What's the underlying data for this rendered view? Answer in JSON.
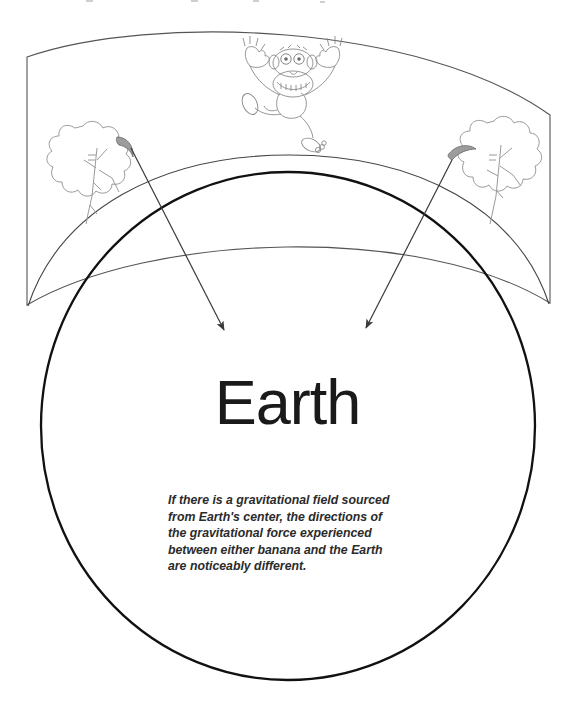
{
  "figure": {
    "title": "Earth",
    "caption": "If there is a gravitational field sourced from Earth's center, the directions of the gravitational force experienced between either banana and the Earth are noticeably different.",
    "colors": {
      "earth_outline": "#111111",
      "ground_band_outline": "#555555",
      "sketch_line": "#8d8d8d",
      "arrow": "#3a3a3a",
      "text": "#1a1a1a",
      "background": "#ffffff"
    },
    "elements": {
      "earth_circle": "earth-circle",
      "inner_arc": "earth-inner-arc",
      "ground_band": "curved-ground-band",
      "left_tree": "tree-left",
      "right_tree": "tree-right",
      "left_banana": "banana-left",
      "right_banana": "banana-right",
      "monkey": "monkey-figure",
      "left_arrow": "gravity-arrow-left",
      "right_arrow": "gravity-arrow-right"
    }
  }
}
